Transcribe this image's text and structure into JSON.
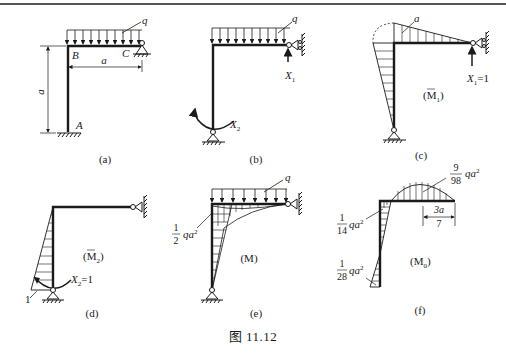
{
  "figure": {
    "caption": "图 11.12",
    "panels": [
      {
        "id": "a",
        "label": "(a)",
        "load_label": "q",
        "node_labels": {
          "A": "A",
          "B": "B",
          "C": "C"
        },
        "dimensions": {
          "horizontal": "a",
          "vertical": "a"
        }
      },
      {
        "id": "b",
        "label": "(b)",
        "load_label": "q",
        "unknowns": {
          "x1": "X",
          "x1_sub": "1",
          "x2": "X",
          "x2_sub": "2"
        }
      },
      {
        "id": "c",
        "label": "(c)",
        "diagram_name": "(M",
        "diagram_sub": "1",
        "diagram_close": ")",
        "value_label": "a",
        "unit_load": {
          "name": "X",
          "sub": "1",
          "value": "=1"
        }
      },
      {
        "id": "d",
        "label": "(d)",
        "diagram_name": "(M",
        "diagram_sub": "2",
        "diagram_close": ")",
        "value_label": "1",
        "unit_load": {
          "name": "X",
          "sub": "2",
          "value": "=1"
        }
      },
      {
        "id": "e",
        "label": "(e)",
        "load_label": "q",
        "diagram_name": "(M)",
        "moment_label": {
          "num": "1",
          "den": "2",
          "tail": "qa",
          "exp": "2"
        }
      },
      {
        "id": "f",
        "label": "(f)",
        "diagram_name": "(M",
        "diagram_sub": "0",
        "diagram_close": ")",
        "span_max": {
          "num": "9",
          "den": "98",
          "tail": "qa",
          "exp": "2"
        },
        "corner_moment": {
          "num": "1",
          "den": "14",
          "tail": "qa",
          "exp": "2"
        },
        "base_moment": {
          "num": "1",
          "den": "28",
          "tail": "qa",
          "exp": "2"
        },
        "offset_dim": {
          "num": "3a",
          "den": "7"
        }
      }
    ]
  }
}
